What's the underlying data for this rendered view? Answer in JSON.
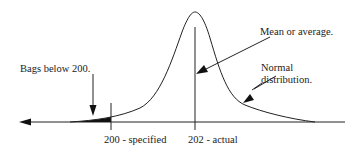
{
  "diagram": {
    "type": "normal-distribution-annotated",
    "labels": {
      "bags_below": "Bags below 200.",
      "mean": "Mean or average.",
      "normal_line1": "Normal",
      "normal_line2": "distribution.",
      "specified": "200 - specified",
      "actual": "202 - actual"
    },
    "values": {
      "specified_value": 200,
      "actual_mean": 202
    },
    "colors": {
      "line": "#222222",
      "fill": "#111111",
      "background": "#ffffff"
    }
  }
}
